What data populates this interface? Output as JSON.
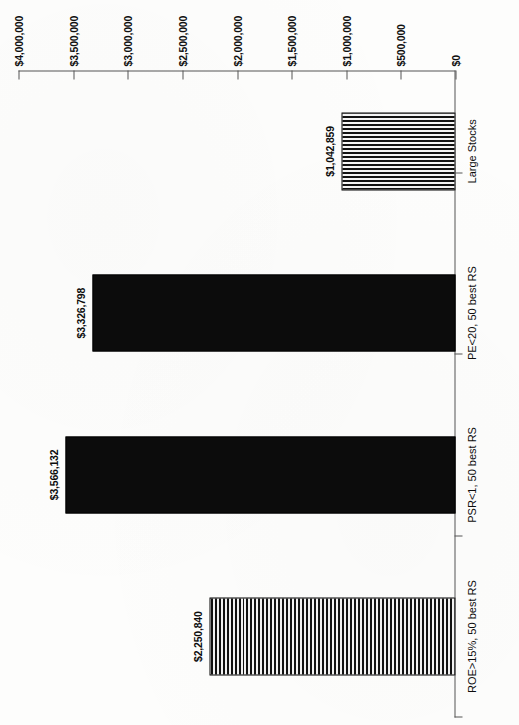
{
  "chart_data": {
    "type": "bar",
    "title": "",
    "subtitle": "",
    "xlabel": "",
    "ylabel": "",
    "orientation": "vertical-bars-rotated-page",
    "grid": false,
    "legend": "none",
    "categories": [
      "ROE>15%, 50 best RS",
      "PSR<1, 50 best RS",
      "PE<20, 50 best RS",
      "Large Stocks"
    ],
    "values": [
      2250840,
      3566132,
      3326798,
      1042859
    ],
    "value_labels": [
      "$2,250,840",
      "$3,566,132",
      "$3,326,798",
      "$1,042,859"
    ],
    "ylim": [
      0,
      4000000
    ],
    "ytick_values": [
      0,
      500000,
      1000000,
      1500000,
      2000000,
      2500000,
      3000000,
      3500000,
      4000000
    ],
    "ytick_labels": [
      "$0",
      "$500,000",
      "$1,000,000",
      "$1,500,000",
      "$2,000,000",
      "$2,500,000",
      "$3,000,000",
      "$3,500,000",
      "$4,000,000"
    ],
    "series_fill_patterns": [
      "horizontal-stripes",
      "solid-black",
      "solid-black",
      "vertical-stripes"
    ],
    "colors": {
      "bar_solid": "#0c0c0c",
      "bar_outline": "#000000",
      "axis": "#555555",
      "text": "#0d0d0d",
      "background": "#fdfdfc"
    }
  }
}
